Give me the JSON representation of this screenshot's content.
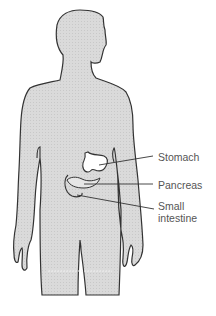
{
  "figure": {
    "colors": {
      "body_fill": "#d9d9d9",
      "outline": "#333333",
      "organ_fill": "#ffffff",
      "label_text": "#555555"
    }
  },
  "labels": [
    {
      "id": "stomach",
      "text": "Stomach"
    },
    {
      "id": "pancreas",
      "text": "Pancreas"
    },
    {
      "id": "small-intestine-1",
      "text": "Small"
    },
    {
      "id": "small-intestine-2",
      "text": "intestine"
    }
  ]
}
